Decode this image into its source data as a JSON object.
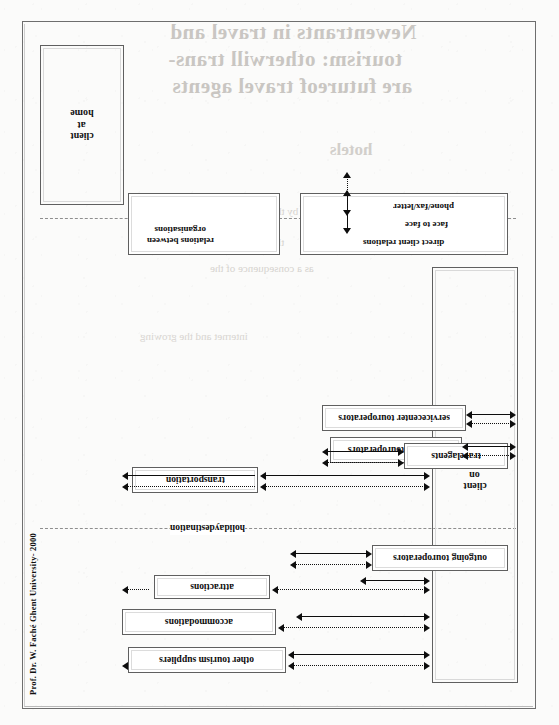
{
  "document": {
    "credit": "Prof. Dr. W. Faché Ghent University- 2000",
    "type": "scanned diagram page",
    "orientation": "landscape figure on portrait page (rotated 90°)"
  },
  "regions": {
    "left_label": "holidaydestination",
    "right_label": "homeland"
  },
  "actors": {
    "client_on_holiday": "client\non\nholiday",
    "client_at_home": "client\nat\nhome"
  },
  "destination_suppliers": [
    {
      "id": "attractions",
      "label": "attractions"
    },
    {
      "id": "accommodations",
      "label": "accommodations"
    },
    {
      "id": "other-tourism-suppliers",
      "label": "other tourism suppliers"
    },
    {
      "id": "transportation",
      "label": "transportation"
    }
  ],
  "intermediaries": [
    {
      "id": "incoming-touroperators",
      "label": "incoming touroperators"
    },
    {
      "id": "servicecenter-touroperators",
      "label": "servicecenter touroperators"
    },
    {
      "id": "outgoing-touroperators",
      "label": "outgoing touroperators"
    },
    {
      "id": "travelagents",
      "label": "travelagents"
    }
  ],
  "legend": {
    "direct": {
      "title": "direct client relations",
      "face_to_face": "face to face",
      "phone_fax_letter": "phone/fax/letter"
    },
    "organisations": {
      "title": "relations between\norganisations"
    }
  },
  "bleed_through": {
    "line1": "Newentrants in travel and",
    "line2": "tourism: otherwill trans-",
    "line3": "are futureof travel agents",
    "line4": "hotels",
    "line5": "are introduced by the new",
    "line6": "the travel agency sector",
    "line7": "as a consequence of the",
    "line8": "internet and the growing"
  },
  "colors": {
    "ink": "#0d0d0d",
    "frame": "#5f5f5f",
    "paper": "#fdfdfc",
    "bleed": "#c9c6c2"
  }
}
